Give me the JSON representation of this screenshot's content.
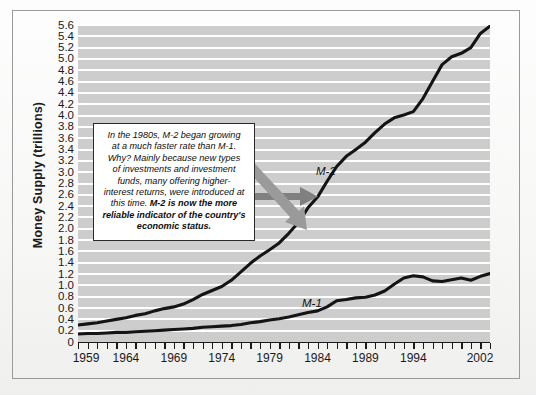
{
  "chart_data": {
    "type": "line",
    "title": "",
    "xlabel": "",
    "ylabel": "Money Supply (trillions)",
    "xlim": [
      1959,
      2002
    ],
    "ylim": [
      0,
      5.6
    ],
    "grid": true,
    "legend_position": "inline-annotation",
    "x_tick_labels": [
      "1959",
      "1964",
      "1969",
      "1974",
      "1979",
      "1984",
      "1989",
      "1994",
      "2002"
    ],
    "x_tick_values": [
      1959,
      1964,
      1969,
      1974,
      1979,
      1984,
      1989,
      1994,
      2002
    ],
    "y_tick_labels": [
      "5.6",
      "5.4",
      "5.2",
      "5.0",
      "4.8",
      "4.6",
      "4.4",
      "4.2",
      "4.0",
      "3.8",
      "3.6",
      "3.4",
      "3.2",
      "3.0",
      "2.8",
      "2.6",
      "2.4",
      "2.2",
      "2.0",
      "1.8",
      "1.6",
      "1.4",
      "1.2",
      "1.0",
      "0.8",
      "0.6",
      "0.4",
      "0.2",
      "0"
    ],
    "y_tick_values": [
      5.6,
      5.4,
      5.2,
      5.0,
      4.8,
      4.6,
      4.4,
      4.2,
      4.0,
      3.8,
      3.6,
      3.4,
      3.2,
      3.0,
      2.8,
      2.6,
      2.4,
      2.2,
      2.0,
      1.8,
      1.6,
      1.4,
      1.2,
      1.0,
      0.8,
      0.6,
      0.4,
      0.2,
      0
    ],
    "x": [
      1959,
      1960,
      1961,
      1962,
      1963,
      1964,
      1965,
      1966,
      1967,
      1968,
      1969,
      1970,
      1971,
      1972,
      1973,
      1974,
      1975,
      1976,
      1977,
      1978,
      1979,
      1980,
      1981,
      1982,
      1983,
      1984,
      1985,
      1986,
      1987,
      1988,
      1989,
      1990,
      1991,
      1992,
      1993,
      1994,
      1995,
      1996,
      1997,
      1998,
      1999,
      2000,
      2001,
      2002
    ],
    "series": [
      {
        "name": "M-2",
        "label": "M-2",
        "color": "#141414",
        "values": [
          0.3,
          0.32,
          0.34,
          0.37,
          0.4,
          0.43,
          0.47,
          0.5,
          0.55,
          0.59,
          0.62,
          0.67,
          0.75,
          0.84,
          0.91,
          0.98,
          1.09,
          1.24,
          1.39,
          1.52,
          1.63,
          1.75,
          1.92,
          2.11,
          2.37,
          2.56,
          2.84,
          3.1,
          3.28,
          3.4,
          3.53,
          3.7,
          3.85,
          3.96,
          4.01,
          4.07,
          4.3,
          4.6,
          4.9,
          5.04,
          5.1,
          5.2,
          5.45,
          5.58
        ]
      },
      {
        "name": "M-1",
        "label": "M-1",
        "color": "#141414",
        "values": [
          0.14,
          0.15,
          0.15,
          0.16,
          0.17,
          0.17,
          0.18,
          0.19,
          0.2,
          0.21,
          0.22,
          0.23,
          0.24,
          0.26,
          0.27,
          0.28,
          0.29,
          0.31,
          0.34,
          0.36,
          0.39,
          0.41,
          0.44,
          0.48,
          0.52,
          0.55,
          0.62,
          0.73,
          0.75,
          0.78,
          0.79,
          0.83,
          0.9,
          1.02,
          1.13,
          1.17,
          1.15,
          1.08,
          1.07,
          1.1,
          1.13,
          1.09,
          1.16,
          1.21
        ]
      }
    ],
    "annotations": [
      {
        "name": "callout-box",
        "lines": [
          "In the 1980s, M-2 began growing",
          "at a much faster rate than M-1.",
          "Why? Mainly because new types",
          "of investments and investment",
          "funds, many offering higher-",
          "interest returns, were introduced at",
          "this time."
        ],
        "emphasis": "M-2 is now the more reliable indicator of the country's economic status."
      }
    ],
    "arrows": [
      {
        "name": "arrow-to-m2",
        "direction": "right",
        "color": "#808080"
      },
      {
        "name": "arrow-to-m1",
        "direction": "down-right",
        "color": "#9a9a9a"
      }
    ],
    "colors": {
      "plot_background": "#cdcdcd",
      "gridline": "#ffffff",
      "line": "#141414",
      "arrow": "#808080",
      "frame": "#9a9a9a"
    }
  }
}
